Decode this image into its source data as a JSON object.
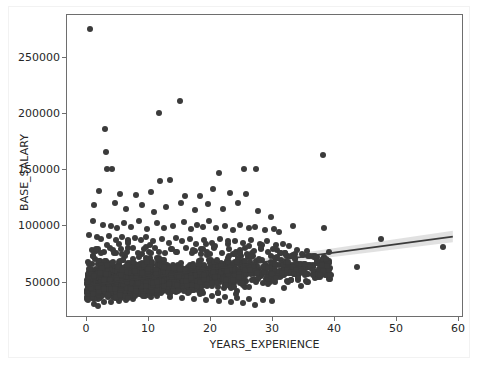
{
  "chart_data": {
    "type": "scatter",
    "title": "",
    "xlabel": "YEARS_EXPERIENCE",
    "ylabel": "BASE_SALARY",
    "xlim": [
      -3.2,
      61.5
    ],
    "ylim": [
      18000,
      287000
    ],
    "xticks": [
      0,
      10,
      20,
      30,
      40,
      50,
      60
    ],
    "xtick_labels": [
      "0",
      "10",
      "20",
      "30",
      "40",
      "50",
      "60"
    ],
    "yticks": [
      50000,
      100000,
      150000,
      200000,
      250000
    ],
    "ytick_labels": [
      "50000",
      "100000",
      "150000",
      "200000",
      "250000"
    ],
    "grid": false,
    "legend": null,
    "point_color": "#3b3b3b",
    "point_size": 6,
    "regression": {
      "type": "linear-fit-with-ci",
      "line_color": "#3b3b3b",
      "band_color": "#c9c9c9",
      "x_start": 0,
      "x_end": 60,
      "y_start": 45000,
      "y_end": 89000,
      "slope": 733,
      "intercept": 45000,
      "ci_halfwidth_start": 1200,
      "ci_halfwidth_end": 5200
    },
    "outliers": [
      {
        "x": 0.6,
        "y": 275000
      },
      {
        "x": 15.2,
        "y": 211000
      },
      {
        "x": 11.8,
        "y": 200000
      },
      {
        "x": 3.0,
        "y": 186000
      },
      {
        "x": 3.1,
        "y": 165000
      },
      {
        "x": 3.3,
        "y": 150000
      },
      {
        "x": 4.2,
        "y": 150000
      },
      {
        "x": 12.0,
        "y": 140000
      },
      {
        "x": 13.6,
        "y": 141000
      },
      {
        "x": 21.6,
        "y": 147000
      },
      {
        "x": 25.6,
        "y": 150000
      },
      {
        "x": 27.6,
        "y": 150000
      },
      {
        "x": 38.5,
        "y": 163000
      },
      {
        "x": 44.0,
        "y": 63000
      },
      {
        "x": 48.0,
        "y": 88000
      },
      {
        "x": 58.0,
        "y": 81000
      }
    ],
    "points": [
      [
        0.6,
        275000
      ],
      [
        15.2,
        211000
      ],
      [
        11.8,
        200000
      ],
      [
        3.0,
        186000
      ],
      [
        3.1,
        165000
      ],
      [
        3.3,
        150000
      ],
      [
        4.2,
        150000
      ],
      [
        12.0,
        140000
      ],
      [
        13.6,
        141000
      ],
      [
        21.6,
        147000
      ],
      [
        25.6,
        150000
      ],
      [
        27.6,
        150000
      ],
      [
        38.5,
        163000
      ],
      [
        44.0,
        63000
      ],
      [
        48.0,
        88000
      ],
      [
        58.0,
        81000
      ],
      [
        2.0,
        131000
      ],
      [
        5.4,
        128000
      ],
      [
        8.0,
        127000
      ],
      [
        10.5,
        130000
      ],
      [
        16.0,
        126000
      ],
      [
        18.4,
        126000
      ],
      [
        20.6,
        133000
      ],
      [
        23.4,
        129000
      ],
      [
        26.0,
        128000
      ],
      [
        1.2,
        118000
      ],
      [
        4.6,
        120000
      ],
      [
        6.4,
        115000
      ],
      [
        9.0,
        118000
      ],
      [
        11.0,
        112000
      ],
      [
        13.0,
        117000
      ],
      [
        15.4,
        120000
      ],
      [
        17.6,
        114000
      ],
      [
        19.8,
        119000
      ],
      [
        22.2,
        115000
      ],
      [
        24.6,
        120000
      ],
      [
        28.0,
        113000
      ],
      [
        30.0,
        108000
      ],
      [
        1.0,
        104000
      ],
      [
        2.6,
        101000
      ],
      [
        4.0,
        100000
      ],
      [
        5.0,
        98000
      ],
      [
        6.0,
        102000
      ],
      [
        7.2,
        99000
      ],
      [
        8.6,
        104000
      ],
      [
        9.8,
        97000
      ],
      [
        11.4,
        102000
      ],
      [
        12.6,
        98000
      ],
      [
        14.0,
        100000
      ],
      [
        15.8,
        103000
      ],
      [
        17.0,
        97000
      ],
      [
        18.0,
        101000
      ],
      [
        19.0,
        99000
      ],
      [
        20.0,
        104000
      ],
      [
        21.0,
        98000
      ],
      [
        22.6,
        100000
      ],
      [
        23.8,
        96000
      ],
      [
        25.0,
        101000
      ],
      [
        26.4,
        98000
      ],
      [
        27.4,
        99000
      ],
      [
        29.0,
        96000
      ],
      [
        30.6,
        97000
      ],
      [
        31.4,
        94000
      ],
      [
        0.4,
        92000
      ],
      [
        1.6,
        90000
      ],
      [
        2.4,
        88000
      ],
      [
        3.6,
        91000
      ],
      [
        4.8,
        87000
      ],
      [
        5.8,
        90000
      ],
      [
        6.8,
        86000
      ],
      [
        7.8,
        89000
      ],
      [
        8.8,
        87000
      ],
      [
        9.6,
        90000
      ],
      [
        10.8,
        86000
      ],
      [
        12.2,
        88000
      ],
      [
        13.4,
        85000
      ],
      [
        14.6,
        89000
      ],
      [
        15.6,
        86000
      ],
      [
        16.8,
        88000
      ],
      [
        17.8,
        84000
      ],
      [
        19.2,
        87000
      ],
      [
        20.4,
        85000
      ],
      [
        21.8,
        88000
      ],
      [
        23.0,
        84000
      ],
      [
        24.2,
        86000
      ],
      [
        25.4,
        85000
      ],
      [
        26.8,
        87000
      ],
      [
        28.2,
        84000
      ],
      [
        29.4,
        86000
      ],
      [
        30.8,
        83000
      ],
      [
        32.0,
        84000
      ],
      [
        33.0,
        82000
      ],
      [
        0.8,
        78000
      ],
      [
        1.8,
        79000
      ],
      [
        2.8,
        77000
      ],
      [
        3.8,
        80000
      ],
      [
        4.4,
        76000
      ],
      [
        5.6,
        79000
      ],
      [
        6.6,
        77000
      ],
      [
        7.6,
        80000
      ],
      [
        8.4,
        76000
      ],
      [
        9.4,
        79000
      ],
      [
        10.2,
        77000
      ],
      [
        11.2,
        80000
      ],
      [
        12.8,
        76000
      ],
      [
        13.8,
        79000
      ],
      [
        14.8,
        77000
      ],
      [
        16.2,
        80000
      ],
      [
        17.2,
        76000
      ],
      [
        18.6,
        79000
      ],
      [
        19.6,
        77000
      ],
      [
        20.8,
        80000
      ],
      [
        22.0,
        76000
      ],
      [
        23.2,
        79000
      ],
      [
        24.4,
        77000
      ],
      [
        25.8,
        80000
      ],
      [
        27.0,
        76000
      ],
      [
        28.4,
        79000
      ],
      [
        29.6,
        77000
      ],
      [
        31.0,
        78000
      ],
      [
        32.4,
        76000
      ],
      [
        34.0,
        75000
      ],
      [
        35.2,
        74000
      ],
      [
        36.4,
        73000
      ],
      [
        37.6,
        72000
      ],
      [
        0.2,
        68000
      ],
      [
        0.9,
        66000
      ],
      [
        1.4,
        70000
      ],
      [
        2.2,
        65000
      ],
      [
        3.2,
        69000
      ],
      [
        4.1,
        64000
      ],
      [
        5.2,
        68000
      ],
      [
        6.2,
        63000
      ],
      [
        7.0,
        67000
      ],
      [
        8.2,
        62000
      ],
      [
        9.2,
        66000
      ],
      [
        10.0,
        61000
      ],
      [
        11.6,
        65000
      ],
      [
        12.4,
        60000
      ],
      [
        13.2,
        64000
      ],
      [
        14.4,
        59000
      ],
      [
        15.0,
        63000
      ],
      [
        16.4,
        58000
      ],
      [
        17.4,
        62000
      ],
      [
        18.2,
        57000
      ],
      [
        19.4,
        61000
      ],
      [
        20.2,
        56000
      ],
      [
        21.2,
        60000
      ],
      [
        22.4,
        55000
      ],
      [
        23.6,
        59000
      ],
      [
        24.8,
        54000
      ],
      [
        26.2,
        58000
      ],
      [
        27.2,
        53000
      ],
      [
        28.6,
        57000
      ],
      [
        29.8,
        52000
      ],
      [
        31.2,
        56000
      ],
      [
        32.6,
        51000
      ],
      [
        34.4,
        55000
      ],
      [
        36.0,
        50000
      ],
      [
        38.0,
        54000
      ],
      [
        0.5,
        45000
      ],
      [
        1.5,
        43000
      ],
      [
        2.5,
        46000
      ],
      [
        3.5,
        42000
      ],
      [
        4.5,
        47000
      ],
      [
        5.5,
        41000
      ],
      [
        6.5,
        44000
      ],
      [
        7.5,
        40000
      ],
      [
        8.5,
        45000
      ],
      [
        9.5,
        39000
      ],
      [
        10.5,
        43000
      ],
      [
        11.5,
        38000
      ],
      [
        12.5,
        42000
      ],
      [
        13.5,
        37000
      ],
      [
        14.5,
        41000
      ],
      [
        15.5,
        36000
      ],
      [
        16.5,
        40000
      ],
      [
        17.5,
        35000
      ],
      [
        18.5,
        39000
      ],
      [
        19.5,
        34000
      ],
      [
        20.5,
        38000
      ],
      [
        21.5,
        33000
      ],
      [
        22.5,
        37000
      ],
      [
        23.5,
        32000
      ],
      [
        24.5,
        36000
      ],
      [
        25.5,
        31000
      ],
      [
        26.5,
        35000
      ],
      [
        27.5,
        30000
      ],
      [
        28.8,
        34000
      ],
      [
        30.2,
        33000
      ]
    ]
  }
}
